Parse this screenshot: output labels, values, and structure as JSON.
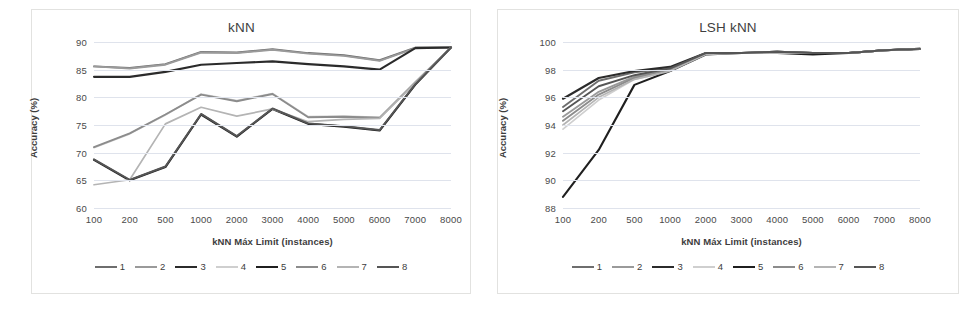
{
  "figure": {
    "panels": [
      "knn",
      "lsh_knn"
    ]
  },
  "common": {
    "xlabel": "kNN Máx Limit (instances)",
    "ylabel": "Accuracy (%)",
    "categories": [
      "100",
      "200",
      "500",
      "1000",
      "2000",
      "3000",
      "4000",
      "5000",
      "6000",
      "7000",
      "8000"
    ],
    "legend_labels": [
      "1",
      "2",
      "3",
      "4",
      "5",
      "6",
      "7",
      "8"
    ],
    "series_colors": [
      "#6e6e6e",
      "#9a9a9a",
      "#2b2b2b",
      "#cfcfcf",
      "#1f1f1f",
      "#8c8c8c",
      "#b4b4b4",
      "#555555"
    ],
    "gridline_color": "#dfe3ec",
    "frame_color": "#e2e2e0",
    "text_color": "#3d3d3d"
  },
  "chart_data": [
    {
      "type": "line",
      "title": "kNN",
      "xlabel": "kNN Máx Limit (instances)",
      "ylabel": "Accuracy (%)",
      "categories": [
        "100",
        "200",
        "500",
        "1000",
        "2000",
        "3000",
        "4000",
        "5000",
        "6000",
        "7000",
        "8000"
      ],
      "ylim": [
        60,
        90
      ],
      "yticks": [
        60,
        65,
        70,
        75,
        80,
        85,
        90
      ],
      "grid": true,
      "legend_position": "bottom",
      "series": [
        {
          "name": "1",
          "color": "#6e6e6e",
          "width": 1.9,
          "values": [
            85.6,
            85.3,
            86.0,
            88.2,
            88.1,
            88.7,
            88.0,
            87.6,
            86.7,
            89.0,
            89.0
          ]
        },
        {
          "name": "2",
          "color": "#9a9a9a",
          "width": 1.9,
          "values": [
            85.6,
            85.2,
            85.9,
            88.1,
            88.0,
            88.6,
            87.9,
            87.5,
            86.6,
            88.9,
            89.0
          ]
        },
        {
          "name": "3",
          "color": "#2b2b2b",
          "width": 2.1,
          "values": [
            83.7,
            83.7,
            84.6,
            85.9,
            86.2,
            86.5,
            86.0,
            85.6,
            85.0,
            88.9,
            89.0
          ]
        },
        {
          "name": "4",
          "color": "#cfcfcf",
          "width": 1.7,
          "values": [
            70.9,
            73.4,
            76.8,
            80.6,
            79.4,
            80.7,
            76.5,
            76.6,
            76.4,
            82.8,
            89.0
          ]
        },
        {
          "name": "5",
          "color": "#1f1f1f",
          "width": 2.1,
          "values": [
            68.7,
            65.0,
            67.4,
            76.9,
            72.9,
            77.9,
            75.2,
            74.7,
            74.0,
            82.3,
            89.0
          ]
        },
        {
          "name": "6",
          "color": "#8c8c8c",
          "width": 1.9,
          "values": [
            71.0,
            73.5,
            76.9,
            80.5,
            79.3,
            80.6,
            76.4,
            76.5,
            76.3,
            82.7,
            89.0
          ]
        },
        {
          "name": "7",
          "color": "#b4b4b4",
          "width": 1.7,
          "values": [
            64.2,
            65.1,
            75.2,
            78.2,
            76.6,
            77.9,
            75.6,
            76.0,
            76.2,
            82.6,
            89.0
          ]
        },
        {
          "name": "8",
          "color": "#555555",
          "width": 1.9,
          "values": [
            68.8,
            65.1,
            67.5,
            77.0,
            73.0,
            78.0,
            75.3,
            74.8,
            74.1,
            82.4,
            89.0
          ]
        }
      ]
    },
    {
      "type": "line",
      "title": "LSH kNN",
      "xlabel": "kNN Máx Limit (instances)",
      "ylabel": "Accuracy (%)",
      "categories": [
        "100",
        "200",
        "500",
        "1000",
        "2000",
        "3000",
        "4000",
        "5000",
        "6000",
        "7000",
        "8000"
      ],
      "ylim": [
        88,
        100
      ],
      "yticks": [
        88,
        90,
        92,
        94,
        96,
        98,
        100
      ],
      "grid": true,
      "legend_position": "bottom",
      "series": [
        {
          "name": "1",
          "color": "#6e6e6e",
          "width": 1.9,
          "values": [
            95.3,
            97.2,
            97.8,
            98.1,
            99.2,
            99.2,
            99.3,
            99.2,
            99.2,
            99.4,
            99.5
          ]
        },
        {
          "name": "2",
          "color": "#9a9a9a",
          "width": 1.9,
          "values": [
            94.6,
            96.4,
            97.5,
            98.0,
            99.2,
            99.2,
            99.3,
            99.2,
            99.2,
            99.4,
            99.5
          ]
        },
        {
          "name": "3",
          "color": "#2b2b2b",
          "width": 2.1,
          "values": [
            95.9,
            97.4,
            97.9,
            98.2,
            99.2,
            99.2,
            99.3,
            99.2,
            99.2,
            99.4,
            99.5
          ]
        },
        {
          "name": "4",
          "color": "#cfcfcf",
          "width": 1.7,
          "values": [
            93.7,
            95.8,
            97.3,
            97.9,
            99.1,
            99.2,
            99.2,
            99.2,
            99.2,
            99.4,
            99.5
          ]
        },
        {
          "name": "5",
          "color": "#1f1f1f",
          "width": 2.1,
          "values": [
            88.8,
            92.2,
            96.9,
            97.9,
            99.1,
            99.2,
            99.2,
            99.1,
            99.2,
            99.4,
            99.5
          ]
        },
        {
          "name": "6",
          "color": "#8c8c8c",
          "width": 1.9,
          "values": [
            94.3,
            96.2,
            97.4,
            98.0,
            99.2,
            99.2,
            99.3,
            99.2,
            99.2,
            99.4,
            99.5
          ]
        },
        {
          "name": "7",
          "color": "#b4b4b4",
          "width": 1.7,
          "values": [
            94.0,
            96.0,
            97.3,
            97.9,
            99.1,
            99.2,
            99.2,
            99.2,
            99.2,
            99.4,
            99.5
          ]
        },
        {
          "name": "8",
          "color": "#555555",
          "width": 1.9,
          "values": [
            95.0,
            96.8,
            97.6,
            98.1,
            99.2,
            99.2,
            99.3,
            99.2,
            99.2,
            99.4,
            99.5
          ]
        }
      ]
    }
  ]
}
